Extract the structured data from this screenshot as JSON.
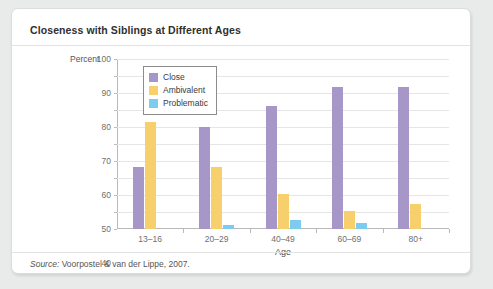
{
  "chart_data": {
    "type": "bar",
    "title": "Closeness with Siblings at Different Ages",
    "xlabel": "Age",
    "ylabel": "Percent",
    "ylim": [
      0,
      100
    ],
    "ytick_step": 10,
    "yticks": [
      100,
      90,
      80,
      70,
      60,
      50,
      40,
      30,
      20,
      10,
      0
    ],
    "grid": true,
    "legend_position": "upper-left-inside",
    "categories": [
      "13–16",
      "20–29",
      "40–49",
      "60–69",
      "80+"
    ],
    "series": [
      {
        "name": "Close",
        "color": "#a796c8",
        "values": [
          36.5,
          60,
          72.5,
          83.5,
          83.5
        ]
      },
      {
        "name": "Ambivalent",
        "color": "#f7cf6c",
        "values": [
          63,
          36.5,
          20.5,
          10.5,
          15
        ]
      },
      {
        "name": "Problematic",
        "color": "#7dcbee",
        "values": [
          0,
          2.5,
          5.5,
          3.3,
          0
        ]
      }
    ]
  },
  "source": {
    "label": "Source:",
    "text": " Voorpostel & van der Lippe, 2007."
  }
}
